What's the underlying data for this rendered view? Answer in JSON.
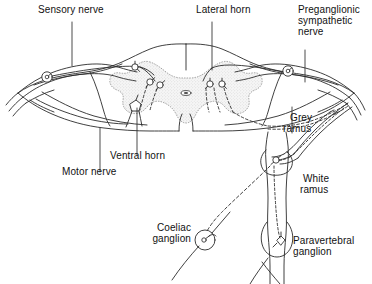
{
  "figure": {
    "type": "anatomical-diagram",
    "stroke_color": "#2b2b2b",
    "grey_matter_fill": "#f2f2f2",
    "grey_matter_stipple": "#9a9a9a",
    "background": "#ffffff"
  },
  "labels": {
    "sensory_nerve": "Sensory nerve",
    "lateral_horn": "Lateral horn",
    "preganglionic_sympathetic_nerve_l1": "Preganglionic",
    "preganglionic_sympathetic_nerve_l2": "sympathetic",
    "preganglionic_sympathetic_nerve_l3": "nerve",
    "grey_ramus_l1": "Grey",
    "grey_ramus_l2": "ramus",
    "white_ramus_l1": "White",
    "white_ramus_l2": "ramus",
    "ventral_horn": "Ventral horn",
    "motor_nerve": "Motor nerve",
    "coeliac_ganglion_l1": "Coeliac",
    "coeliac_ganglion_l2": "ganglion",
    "paravertebral_ganglion_l1": "Paravertebral",
    "paravertebral_ganglion_l2": "ganglion"
  },
  "structures": [
    {
      "name": "spinal-cord-white-matter",
      "kind": "outline"
    },
    {
      "name": "spinal-cord-grey-matter",
      "kind": "stippled-butterfly"
    },
    {
      "name": "central-canal",
      "kind": "small-oval"
    },
    {
      "name": "dorsal-root-ganglion-left",
      "kind": "circle-with-neuron"
    },
    {
      "name": "dorsal-root-ganglion-right",
      "kind": "circle-with-neuron"
    },
    {
      "name": "lateral-horn-neurons",
      "kind": "neuron-cluster"
    },
    {
      "name": "ventral-horn-neuron",
      "kind": "neuron"
    },
    {
      "name": "spinal-nerve-left",
      "kind": "nerve-trunk"
    },
    {
      "name": "spinal-nerve-right",
      "kind": "nerve-trunk"
    },
    {
      "name": "sympathetic-chain",
      "kind": "chain"
    },
    {
      "name": "paravertebral-ganglion-upper",
      "kind": "ganglion-with-neuron"
    },
    {
      "name": "paravertebral-ganglion-lower",
      "kind": "fusiform-ganglion"
    },
    {
      "name": "white-ramus-communicans",
      "kind": "ramus"
    },
    {
      "name": "grey-ramus-communicans",
      "kind": "ramus"
    },
    {
      "name": "coeliac-ganglion",
      "kind": "circle-with-neuron"
    },
    {
      "name": "preganglionic-fiber-dashed",
      "kind": "dashed-path"
    },
    {
      "name": "postganglionic-fiber",
      "kind": "solid-path"
    }
  ]
}
